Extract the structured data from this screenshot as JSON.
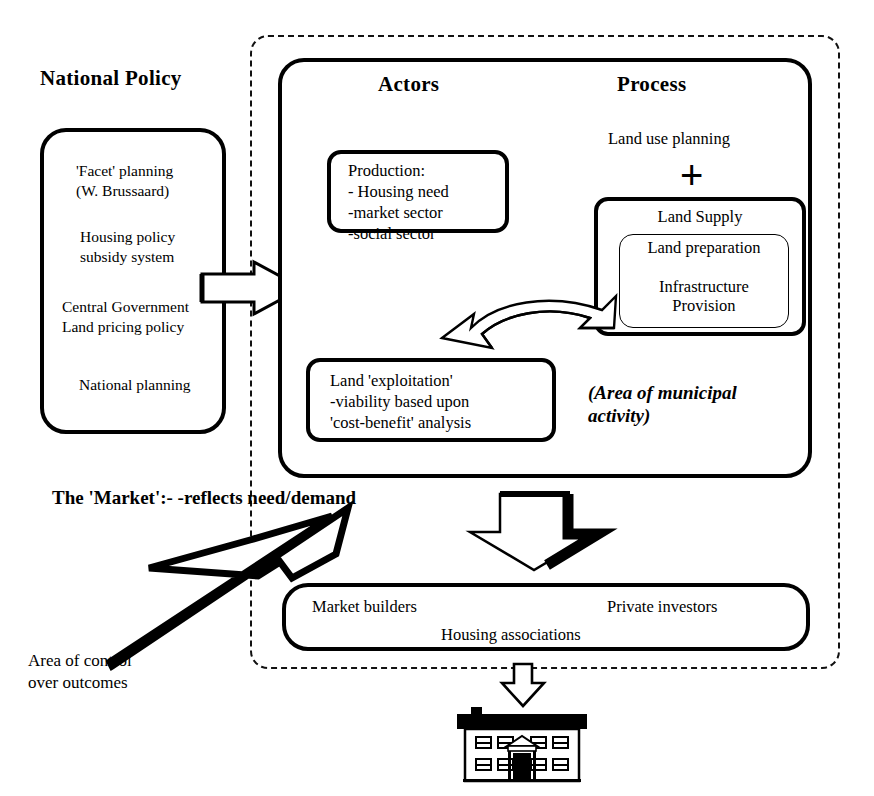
{
  "diagram": {
    "title_left": "National Policy",
    "columns": {
      "actors": "Actors",
      "process": "Process"
    },
    "national_policy": {
      "items": [
        "'Facet' planning\n(W. Brussaard)",
        "Housing policy\nsubsidy system",
        "Central Government\nLand pricing policy",
        "National planning"
      ]
    },
    "actors": {
      "production_box": "Production:\n- Housing need\n-market sector\n-social sector"
    },
    "process": {
      "land_use_planning": "Land use planning",
      "plus_symbol": "+",
      "land_supply_label": "Land Supply",
      "land_supply_inner": "Land preparation\n\nInfrastructure\nProvision"
    },
    "exploitation_box": "Land 'exploitation'\n-viability based upon\n'cost-benefit' analysis",
    "municipal_note": "(Area of municipal\nactivity)",
    "market_note": "The 'Market':-\n-reflects\nneed/demand",
    "control_note": "Area of control\nover outcomes",
    "delivery_box": {
      "market_builders": "Market builders",
      "private_investors": "Private investors",
      "housing_associations": "Housing associations"
    },
    "icons": {
      "policy_arrow": "right-arrow-icon",
      "exchange_arrow": "curved-double-arrow-icon",
      "output_arrow": "down-arrow-icon",
      "house_arrow": "down-arrow-small-icon",
      "market_arrow": "market-up-arrow-icon",
      "house": "house-icon"
    },
    "colors": {
      "ink": "#000000",
      "paper": "#ffffff"
    }
  }
}
